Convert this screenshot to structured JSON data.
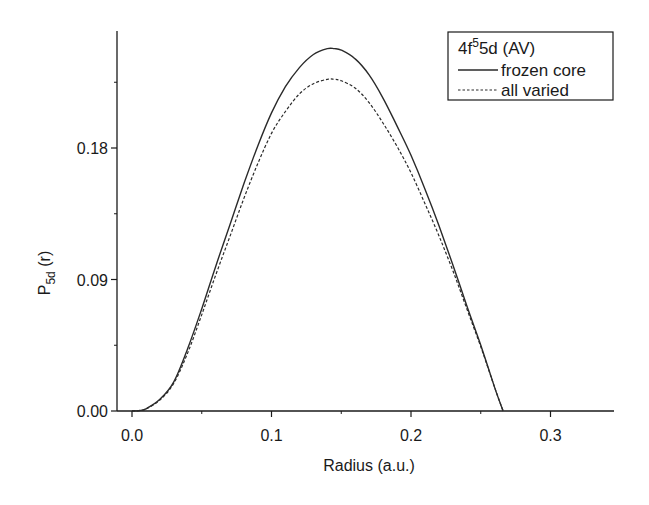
{
  "chart_data": {
    "type": "line",
    "title": "",
    "xlabel": "Radius (a.u.)",
    "ylabel_main": "P",
    "ylabel_sub": "5d",
    "ylabel_tail": " (r)",
    "xlim": [
      -0.0,
      0.34
    ],
    "ylim": [
      0.0,
      0.255
    ],
    "x_ticks": [
      0.0,
      0.1,
      0.2,
      0.3
    ],
    "x_tick_labels": [
      "0.0",
      "0.1",
      "0.2",
      "0.3"
    ],
    "x_minor_ticks": [
      0.05,
      0.15,
      0.25
    ],
    "y_ticks": [
      0.0,
      0.09,
      0.18
    ],
    "y_tick_labels": [
      "0.00",
      "0.09",
      "0.18"
    ],
    "y_minor_ticks": [
      0.045,
      0.135,
      0.225
    ],
    "grid": false,
    "legend": {
      "position": "upper right",
      "title_main": "4f",
      "title_sup": "5",
      "title_tail": "5d (AV)",
      "entries": [
        "frozen core",
        "all varied"
      ]
    },
    "x": [
      0.0,
      0.005,
      0.01,
      0.02,
      0.03,
      0.04,
      0.05,
      0.06,
      0.07,
      0.08,
      0.09,
      0.1,
      0.11,
      0.12,
      0.13,
      0.14,
      0.145,
      0.15,
      0.16,
      0.17,
      0.18,
      0.19,
      0.2,
      0.21,
      0.22,
      0.23,
      0.24,
      0.25,
      0.26,
      0.266
    ],
    "series": [
      {
        "name": "frozen core",
        "style": "solid",
        "values": [
          0.0,
          0.0003,
          0.0015,
          0.008,
          0.02,
          0.043,
          0.07,
          0.099,
          0.127,
          0.155,
          0.181,
          0.204,
          0.222,
          0.235,
          0.244,
          0.248,
          0.248,
          0.247,
          0.241,
          0.23,
          0.214,
          0.195,
          0.175,
          0.152,
          0.127,
          0.1,
          0.072,
          0.045,
          0.016,
          0.0
        ]
      },
      {
        "name": "all varied",
        "style": "dashed",
        "values": [
          0.0,
          0.0003,
          0.0014,
          0.0075,
          0.019,
          0.04,
          0.066,
          0.093,
          0.119,
          0.145,
          0.169,
          0.19,
          0.205,
          0.217,
          0.224,
          0.227,
          0.227,
          0.226,
          0.221,
          0.211,
          0.197,
          0.181,
          0.163,
          0.142,
          0.12,
          0.096,
          0.07,
          0.044,
          0.016,
          0.0
        ]
      }
    ]
  },
  "colors": {
    "axis": "#1a1a1a",
    "line": "#2a2a2a",
    "background": "#ffffff"
  }
}
